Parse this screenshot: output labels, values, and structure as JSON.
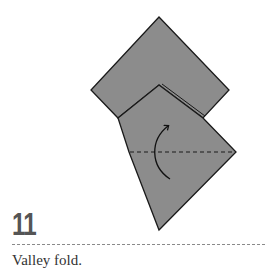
{
  "step": {
    "number": "11",
    "instruction": "Valley fold."
  },
  "diagram": {
    "paper_color": "#8c8c8c",
    "outline_color": "#1a1a1a",
    "fold_type": "valley",
    "arrow_direction": "up"
  }
}
